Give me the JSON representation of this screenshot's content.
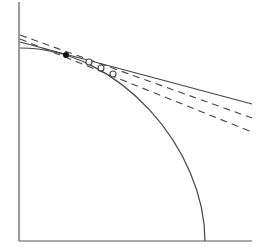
{
  "diagram": {
    "width": 272,
    "height": 251,
    "background": "#ffffff",
    "stroke_color": "#444444",
    "axis_color": "#555555",
    "axes": {
      "origin": [
        19,
        241
      ],
      "y_axis_top": [
        19,
        2
      ],
      "x_axis_end": [
        252,
        241
      ]
    },
    "arc": {
      "start": [
        20,
        48
      ],
      "end": [
        205,
        241
      ],
      "control1": [
        120,
        48
      ],
      "control2": [
        205,
        150
      ]
    },
    "solid_line": {
      "from": [
        20,
        42
      ],
      "to": [
        252,
        104
      ]
    },
    "dashed_lines": [
      {
        "from": [
          20,
          35
        ],
        "to": [
          252,
          118
        ]
      },
      {
        "from": [
          20,
          39
        ],
        "to": [
          252,
          132
        ]
      }
    ],
    "filled_point": {
      "center": [
        66,
        55
      ],
      "r": 3
    },
    "open_points": [
      {
        "center": [
          89,
          62
        ],
        "r": 3
      },
      {
        "center": [
          101,
          68
        ],
        "r": 3
      },
      {
        "center": [
          113,
          74
        ],
        "r": 3
      }
    ]
  }
}
